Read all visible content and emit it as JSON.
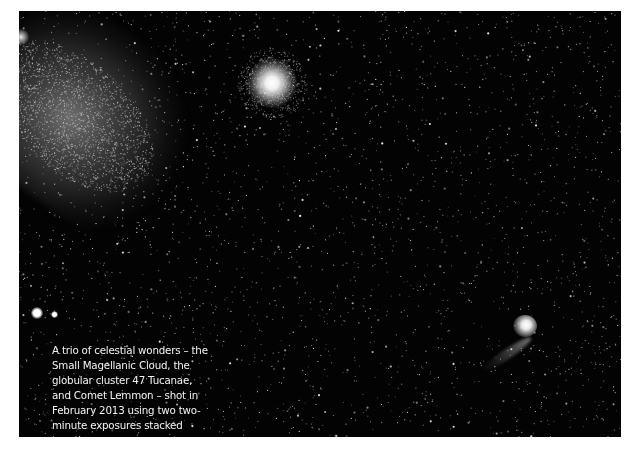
{
  "photo": {
    "subjects": [
      "Small Magellanic Cloud",
      "47 Tucanae",
      "Comet Lemmon"
    ],
    "background_color": "#030303"
  },
  "caption": {
    "text": "A trio of celestial wonders – the Small Magellanic Cloud, the globular cluster 47 Tucanae, and Comet Lemmon – shot in February 2013 using two two-minute exposures stacked together.",
    "credit": "(John Drummond)"
  }
}
